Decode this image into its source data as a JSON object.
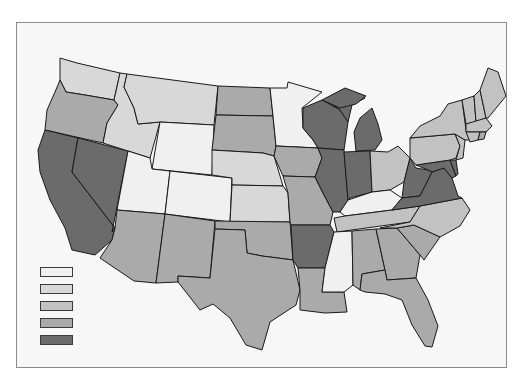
{
  "map": {
    "type": "choropleth",
    "region": "United States (contiguous 48 states)",
    "colors": {
      "level1": "#f0f0f0",
      "level2": "#d8d8d8",
      "level3": "#c2c2c2",
      "level4": "#aaaaaa",
      "level5": "#6b6b6b"
    },
    "legend": {
      "entries": [
        {
          "level": 1,
          "color": "#f0f0f0",
          "label": ""
        },
        {
          "level": 2,
          "color": "#d8d8d8",
          "label": ""
        },
        {
          "level": 3,
          "color": "#c2c2c2",
          "label": ""
        },
        {
          "level": 4,
          "color": "#aaaaaa",
          "label": ""
        },
        {
          "level": 5,
          "color": "#6b6b6b",
          "label": ""
        }
      ]
    },
    "states": {
      "WA": 2,
      "OR": 4,
      "CA": 5,
      "NV": 5,
      "ID": 2,
      "MT": 2,
      "WY": 1,
      "UT": 1,
      "CO": 1,
      "AZ": 4,
      "NM": 4,
      "ND": 4,
      "SD": 4,
      "NE": 2,
      "KS": 2,
      "OK": 4,
      "TX": 4,
      "MN": 1,
      "IA": 4,
      "MO": 4,
      "AR": 5,
      "LA": 4,
      "WI": 5,
      "IL": 5,
      "MI": 5,
      "IN": 5,
      "OH": 3,
      "KY": 1,
      "TN": 3,
      "MS": 1,
      "AL": 4,
      "GA": 4,
      "FL": 4,
      "SC": 4,
      "NC": 3,
      "VA": 5,
      "WV": 5,
      "MD": 5,
      "DE": 5,
      "PA": 3,
      "NJ": 3,
      "NY": 3,
      "CT": 3,
      "RI": 4,
      "MA": 3,
      "VT": 3,
      "NH": 3,
      "ME": 3
    }
  }
}
